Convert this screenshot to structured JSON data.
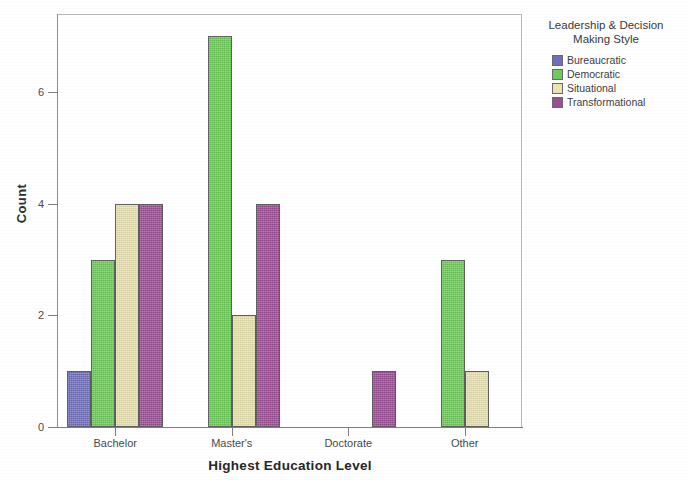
{
  "chart_data": {
    "type": "bar",
    "title": "",
    "xlabel": "Highest Education Level",
    "ylabel": "Count",
    "categories": [
      "Bachelor",
      "Master's",
      "Doctorate",
      "Other"
    ],
    "ylim": [
      0,
      7.4
    ],
    "yticks": [
      0,
      2,
      4,
      6
    ],
    "ytick_labels": [
      "0",
      "2",
      "4",
      "6"
    ],
    "grid": false,
    "legend_position": "right",
    "legend_title": "Leadership & Decision Making Style",
    "series": [
      {
        "name": "Bureaucratic",
        "color": "#6f6fbe",
        "values": [
          1,
          0,
          0,
          0
        ]
      },
      {
        "name": "Democratic",
        "color": "#6ecc5a",
        "values": [
          3,
          7,
          0,
          3
        ]
      },
      {
        "name": "Situational",
        "color": "#e9e4b1",
        "values": [
          4,
          2,
          0,
          1
        ]
      },
      {
        "name": "Transformational",
        "color": "#9c4f96",
        "values": [
          4,
          4,
          1,
          0
        ]
      }
    ]
  },
  "legend": {
    "title_line1": "Leadership & Decision",
    "title_line2": "Making Style"
  }
}
